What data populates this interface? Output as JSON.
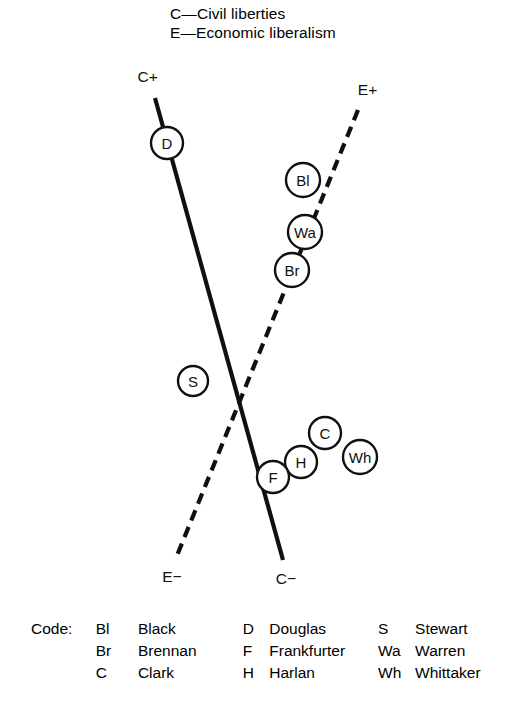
{
  "figure": {
    "key": [
      "C—Civil liberties",
      "E—Economic liberalism"
    ],
    "poles": {
      "civil_positive": "C+",
      "civil_negative": "C−",
      "economic_positive": "E+",
      "economic_negative": "E−"
    },
    "colors": {
      "background": "#ffffff",
      "ink": "#101010",
      "node_fill": "#ffffff"
    }
  },
  "chart_data": {
    "type": "scatter",
    "title": "",
    "subtitle": "",
    "xlabel": "",
    "ylabel": "",
    "grid": false,
    "legend_position": "bottom",
    "axes": [
      {
        "name": "Civil liberties",
        "code": "C",
        "style": "solid",
        "positive_label": "C+",
        "negative_label": "C−",
        "from": [
          155,
          98
        ],
        "to": [
          283,
          560
        ]
      },
      {
        "name": "Economic liberalism",
        "code": "E",
        "style": "dashed",
        "positive_label": "E+",
        "negative_label": "E−",
        "from": [
          358,
          110
        ],
        "to": [
          176,
          558
        ]
      }
    ],
    "intersection": [
      238,
      400
    ],
    "points": [
      {
        "code": "D",
        "name": "Douglas",
        "axis": "Civil liberties",
        "x": 167,
        "y": 143,
        "r": 16
      },
      {
        "code": "Bl",
        "name": "Black",
        "axis": "Economic liberalism",
        "x": 303,
        "y": 180,
        "r": 17
      },
      {
        "code": "Wa",
        "name": "Warren",
        "axis": "Economic liberalism",
        "x": 305,
        "y": 232,
        "r": 17
      },
      {
        "code": "Br",
        "name": "Brennan",
        "axis": "Economic liberalism",
        "x": 292,
        "y": 270,
        "r": 17
      },
      {
        "code": "S",
        "name": "Stewart",
        "axis": "",
        "x": 193,
        "y": 381,
        "r": 15
      },
      {
        "code": "C",
        "name": "Clark",
        "axis": "",
        "x": 325,
        "y": 433,
        "r": 16
      },
      {
        "code": "Wh",
        "name": "Whittaker",
        "axis": "",
        "x": 360,
        "y": 457,
        "r": 17
      },
      {
        "code": "H",
        "name": "Harlan",
        "axis": "",
        "x": 301,
        "y": 462,
        "r": 16
      },
      {
        "code": "F",
        "name": "Frankfurter",
        "axis": "Civil liberties",
        "x": 273,
        "y": 477,
        "r": 16
      }
    ]
  },
  "legend": {
    "title": "Code:",
    "columns": [
      [
        {
          "code": "Bl",
          "name": "Black"
        },
        {
          "code": "Br",
          "name": "Brennan"
        },
        {
          "code": "C",
          "name": "Clark"
        }
      ],
      [
        {
          "code": "D",
          "name": "Douglas"
        },
        {
          "code": "F",
          "name": "Frankfurter"
        },
        {
          "code": "H",
          "name": "Harlan"
        }
      ],
      [
        {
          "code": "S",
          "name": "Stewart"
        },
        {
          "code": "Wa",
          "name": "Warren"
        },
        {
          "code": "Wh",
          "name": "Whittaker"
        }
      ]
    ]
  }
}
